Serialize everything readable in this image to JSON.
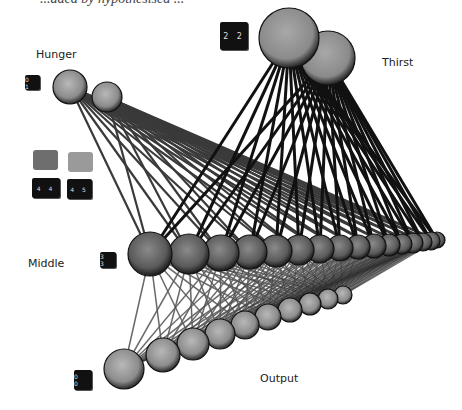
{
  "header": {
    "cut_text": "...aded by hypothesised ..."
  },
  "labels": {
    "hunger": "Hunger",
    "thirst": "Thirst",
    "middle": "Middle",
    "output": "Output"
  },
  "cubes": {
    "hunger_cube": "0 1",
    "thirst_cube": "2 2",
    "legend_cube_a": "4 4",
    "legend_cube_b": "4 5",
    "middle_cube": "3 3",
    "output_cube": "0 0"
  },
  "legend_swatches": {
    "swatch_a_color": "#6e6e6e",
    "swatch_b_color": "#9a9a9a"
  },
  "network": {
    "hunger_nodes": [
      {
        "x": 70,
        "y": 87,
        "r": 17
      },
      {
        "x": 107,
        "y": 97,
        "r": 15
      }
    ],
    "thirst_nodes": [
      {
        "x": 289,
        "y": 38,
        "r": 30
      },
      {
        "x": 328,
        "y": 58,
        "r": 27
      }
    ],
    "middle_nodes": [
      {
        "x": 150,
        "y": 254,
        "r": 22
      },
      {
        "x": 189,
        "y": 254,
        "r": 20
      },
      {
        "x": 221,
        "y": 253,
        "r": 18
      },
      {
        "x": 250,
        "y": 252,
        "r": 17
      },
      {
        "x": 276,
        "y": 251,
        "r": 16
      },
      {
        "x": 299,
        "y": 250,
        "r": 15
      },
      {
        "x": 320,
        "y": 249,
        "r": 14
      },
      {
        "x": 340,
        "y": 248,
        "r": 13
      },
      {
        "x": 358,
        "y": 247,
        "r": 12
      },
      {
        "x": 374,
        "y": 246,
        "r": 12
      },
      {
        "x": 389,
        "y": 245,
        "r": 11
      },
      {
        "x": 402,
        "y": 244,
        "r": 10
      },
      {
        "x": 413,
        "y": 243,
        "r": 10
      },
      {
        "x": 423,
        "y": 242,
        "r": 9
      },
      {
        "x": 431,
        "y": 241,
        "r": 9
      },
      {
        "x": 437,
        "y": 240,
        "r": 8
      }
    ],
    "output_nodes": [
      {
        "x": 124,
        "y": 369,
        "r": 20
      },
      {
        "x": 163,
        "y": 355,
        "r": 17
      },
      {
        "x": 193,
        "y": 344,
        "r": 16
      },
      {
        "x": 220,
        "y": 334,
        "r": 15
      },
      {
        "x": 245,
        "y": 325,
        "r": 14
      },
      {
        "x": 268,
        "y": 317,
        "r": 13
      },
      {
        "x": 290,
        "y": 310,
        "r": 12
      },
      {
        "x": 310,
        "y": 304,
        "r": 11
      },
      {
        "x": 328,
        "y": 299,
        "r": 10
      },
      {
        "x": 343,
        "y": 295,
        "r": 9
      }
    ]
  }
}
